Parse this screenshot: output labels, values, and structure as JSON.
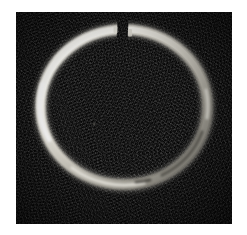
{
  "image": {
    "kind": "photograph",
    "subject": "open metal ring with gap",
    "description": "Grayscale close-up photograph of a bright metallic split ring (open circlet) lying on a black background, with a narrow gap at the top of the ring slightly right of center.",
    "orientation": "upright",
    "canvas": {
      "width_px": 247,
      "height_px": 235,
      "background_color": "#ffffff"
    },
    "plate": {
      "left_px": 16,
      "top_px": 12,
      "width_px": 216,
      "height_px": 212,
      "background_color": "#0d0d0d",
      "texture": "film grain speckle"
    },
    "ring": {
      "center_x_px": 108,
      "center_y_px": 95,
      "outer_radius_x_px": 88,
      "outer_radius_y_px": 82,
      "band_thickness_px": 9,
      "highlight_color": "#f5f4ef",
      "midtone_color": "#b9b6ad",
      "shadow_color": "#4a4843",
      "gap": {
        "position": "top",
        "angle_deg": 272,
        "width_px": 11,
        "left_terminus_x_px": 101,
        "right_terminus_x_px": 112,
        "terminus_y_px": 22
      },
      "brightest_region": "upper-left and left",
      "dimmest_region": "lower-right"
    }
  }
}
